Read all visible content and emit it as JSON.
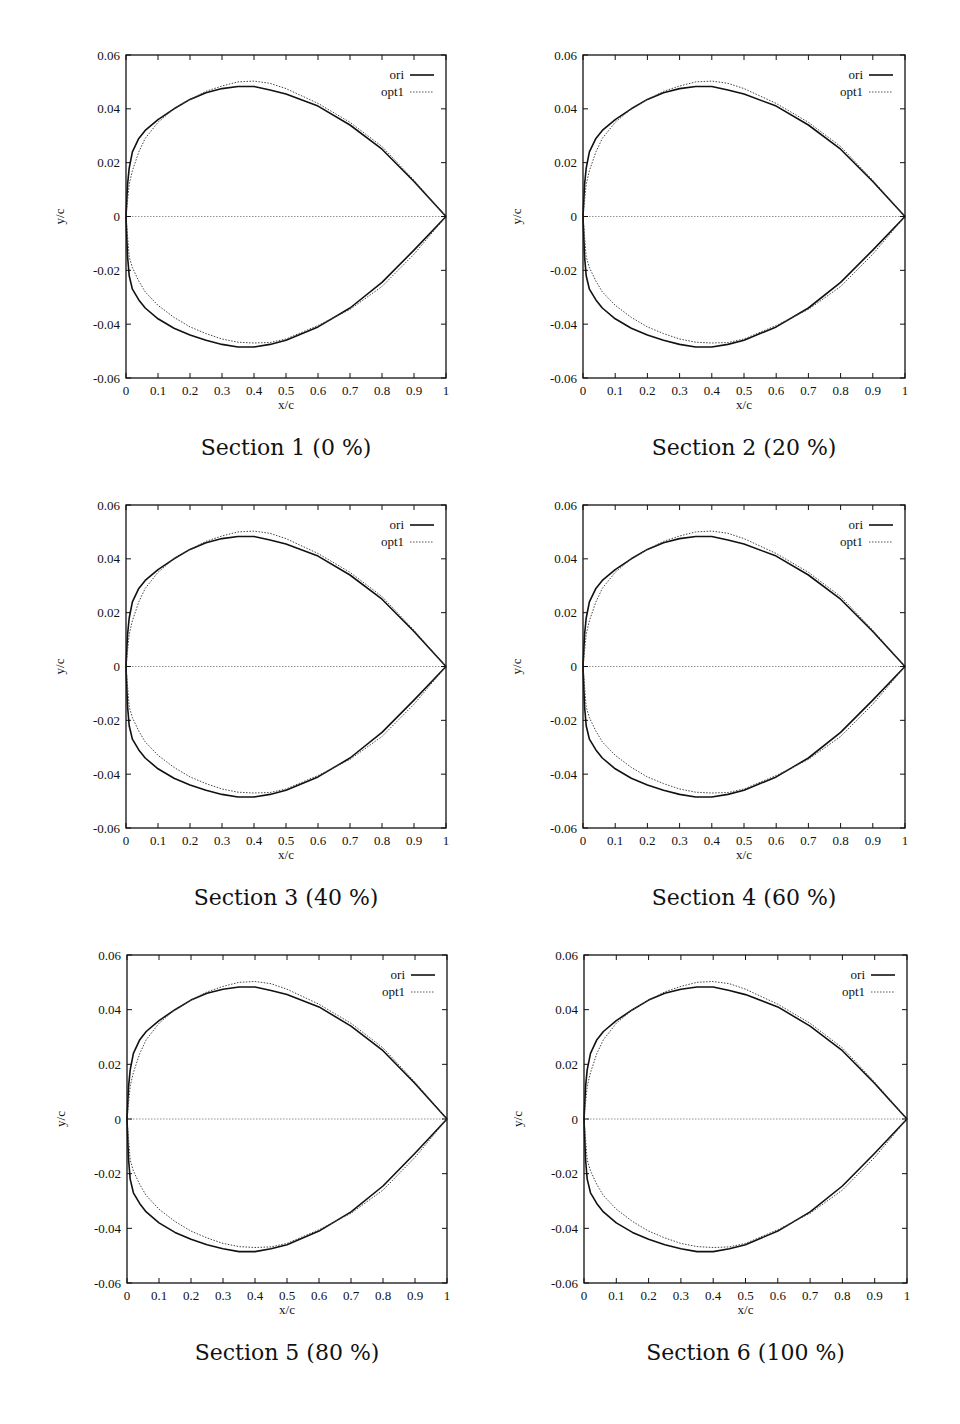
{
  "chart_data": {
    "type": "line",
    "layout": {
      "rows": 3,
      "cols": 2,
      "grid": false,
      "legend_position": "top-right"
    },
    "shared": {
      "xlabel": "x/c",
      "ylabel": "y/c",
      "xlim": [
        0,
        1
      ],
      "ylim": [
        -0.06,
        0.06
      ],
      "xticks": [
        "0",
        "0.1",
        "0.2",
        "0.3",
        "0.4",
        "0.5",
        "0.6",
        "0.7",
        "0.8",
        "0.9",
        "1"
      ],
      "yticks": [
        "0.06",
        "0.04",
        "0.02",
        "0",
        "-0.02",
        "-0.04",
        "-0.06"
      ],
      "legend": [
        {
          "name": "ori",
          "style": "solid",
          "color": "#111111"
        },
        {
          "name": "opt1",
          "style": "dotted",
          "color": "#555555"
        }
      ],
      "series": [
        {
          "name": "ori",
          "upper": {
            "x": [
              0,
              0.005,
              0.01,
              0.02,
              0.04,
              0.06,
              0.1,
              0.15,
              0.2,
              0.25,
              0.3,
              0.35,
              0.4,
              0.45,
              0.5,
              0.6,
              0.7,
              0.8,
              0.9,
              0.95,
              1
            ],
            "y": [
              0,
              0.012,
              0.018,
              0.024,
              0.029,
              0.032,
              0.036,
              0.04,
              0.0435,
              0.046,
              0.0475,
              0.0483,
              0.0483,
              0.047,
              0.0455,
              0.041,
              0.034,
              0.025,
              0.013,
              0.0065,
              0
            ]
          },
          "lower": {
            "x": [
              0,
              0.005,
              0.01,
              0.02,
              0.04,
              0.06,
              0.1,
              0.15,
              0.2,
              0.25,
              0.3,
              0.35,
              0.4,
              0.45,
              0.5,
              0.6,
              0.7,
              0.8,
              0.9,
              1
            ],
            "y": [
              0,
              -0.015,
              -0.022,
              -0.027,
              -0.031,
              -0.034,
              -0.038,
              -0.0415,
              -0.044,
              -0.046,
              -0.0475,
              -0.0485,
              -0.0485,
              -0.0475,
              -0.046,
              -0.041,
              -0.034,
              -0.0245,
              -0.0125,
              0
            ]
          }
        },
        {
          "name": "opt1",
          "upper": {
            "x": [
              0,
              0.01,
              0.02,
              0.04,
              0.06,
              0.1,
              0.15,
              0.2,
              0.25,
              0.3,
              0.35,
              0.4,
              0.45,
              0.5,
              0.6,
              0.7,
              0.8,
              0.9,
              1
            ],
            "y": [
              0,
              0.012,
              0.017,
              0.024,
              0.029,
              0.035,
              0.04,
              0.0435,
              0.0465,
              0.0485,
              0.05,
              0.0503,
              0.0495,
              0.0475,
              0.042,
              0.035,
              0.026,
              0.0135,
              0
            ]
          },
          "lower": {
            "x": [
              0,
              0.01,
              0.02,
              0.04,
              0.06,
              0.1,
              0.15,
              0.2,
              0.25,
              0.3,
              0.35,
              0.4,
              0.45,
              0.5,
              0.6,
              0.7,
              0.8,
              0.9,
              1
            ],
            "y": [
              0,
              -0.015,
              -0.019,
              -0.024,
              -0.028,
              -0.033,
              -0.0375,
              -0.041,
              -0.0435,
              -0.0455,
              -0.0467,
              -0.047,
              -0.0468,
              -0.0455,
              -0.0405,
              -0.0345,
              -0.026,
              -0.014,
              0
            ]
          }
        }
      ],
      "annotations": [
        "horizontal zero line (chord) at y/c = 0"
      ]
    },
    "charts": [
      {
        "title": "Section 1 (0 %)",
        "box": {
          "x": 126,
          "y": 55,
          "w": 320,
          "h": 323
        }
      },
      {
        "title": "Section 2 (20 %)",
        "box": {
          "x": 583,
          "y": 55,
          "w": 322,
          "h": 323
        }
      },
      {
        "title": "Section 3 (40 %)",
        "box": {
          "x": 126,
          "y": 505,
          "w": 320,
          "h": 323
        }
      },
      {
        "title": "Section 4 (60 %)",
        "box": {
          "x": 583,
          "y": 505,
          "w": 322,
          "h": 323
        }
      },
      {
        "title": "Section 5 (80 %)",
        "box": {
          "x": 127,
          "y": 955,
          "w": 320,
          "h": 328
        }
      },
      {
        "title": "Section 6 (100 %)",
        "box": {
          "x": 584,
          "y": 955,
          "w": 323,
          "h": 328
        }
      }
    ]
  }
}
